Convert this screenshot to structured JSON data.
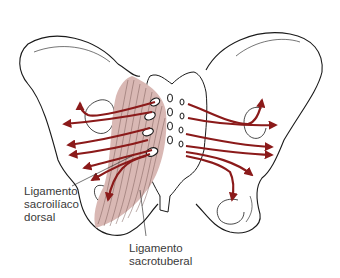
{
  "diagram": {
    "arrow_color": "#8b1a1a",
    "ligament_fill": "#d9b8b4",
    "outline_color": "#1a1a1a",
    "labels": {
      "sacroiliac_dorsal": {
        "line1": "Ligamento",
        "line2": "sacroilíaco",
        "line3": "dorsal"
      },
      "sacrotuberal": {
        "line1": "Ligamento",
        "line2": "sacrotuberal"
      }
    }
  }
}
